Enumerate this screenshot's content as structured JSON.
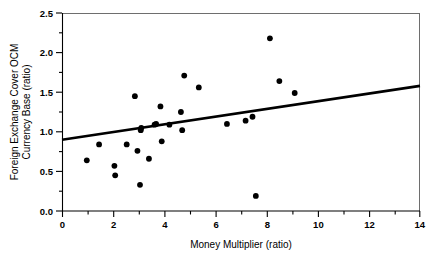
{
  "chart_data": {
    "type": "scatter",
    "title": "",
    "xlabel": "Money Multiplier (ratio)",
    "ylabel": "Foreign Exchange Cover OCM Currency Base (ratio)",
    "ylabel_line1": "Foreign Exchange Cover OCM",
    "ylabel_line2": "Currency Base (ratio)",
    "xlim": [
      0,
      14
    ],
    "ylim": [
      0.0,
      2.5
    ],
    "x_ticks_major": [
      0,
      2,
      4,
      6,
      8,
      10,
      12,
      14
    ],
    "x_ticks_major_labels": [
      "0",
      "2",
      "4",
      "6",
      "8",
      "10",
      "12",
      "14"
    ],
    "x_ticks_minor": [
      1,
      3,
      5,
      7,
      9,
      11,
      13
    ],
    "y_ticks_major": [
      0.0,
      0.5,
      1.0,
      1.5,
      2.0,
      2.5
    ],
    "y_ticks_major_labels": [
      "0.0",
      "0.5",
      "1.0",
      "1.5",
      "2.0",
      "2.5"
    ],
    "y_ticks_minor": [
      0.25,
      0.75,
      1.25,
      1.75,
      2.25
    ],
    "grid": false,
    "legend": "none",
    "marker": "filled-circle",
    "marker_color": "#000000",
    "points": [
      {
        "x": 0.97,
        "y": 0.64
      },
      {
        "x": 1.45,
        "y": 0.84
      },
      {
        "x": 2.05,
        "y": 0.57
      },
      {
        "x": 2.08,
        "y": 0.45
      },
      {
        "x": 2.53,
        "y": 0.84
      },
      {
        "x": 2.85,
        "y": 1.45
      },
      {
        "x": 2.95,
        "y": 0.76
      },
      {
        "x": 3.05,
        "y": 0.33
      },
      {
        "x": 3.08,
        "y": 1.02
      },
      {
        "x": 3.1,
        "y": 1.05
      },
      {
        "x": 3.4,
        "y": 0.66
      },
      {
        "x": 3.62,
        "y": 1.09
      },
      {
        "x": 3.68,
        "y": 1.1
      },
      {
        "x": 3.85,
        "y": 1.32
      },
      {
        "x": 3.9,
        "y": 0.88
      },
      {
        "x": 4.2,
        "y": 1.09
      },
      {
        "x": 4.65,
        "y": 1.25
      },
      {
        "x": 4.7,
        "y": 1.02
      },
      {
        "x": 4.78,
        "y": 1.71
      },
      {
        "x": 5.35,
        "y": 1.56
      },
      {
        "x": 6.45,
        "y": 1.1
      },
      {
        "x": 7.18,
        "y": 1.14
      },
      {
        "x": 7.45,
        "y": 1.19
      },
      {
        "x": 7.58,
        "y": 0.19
      },
      {
        "x": 8.13,
        "y": 2.18
      },
      {
        "x": 8.5,
        "y": 1.64
      },
      {
        "x": 9.1,
        "y": 1.49
      }
    ],
    "trendline": {
      "x_start": 0,
      "y_start": 0.9,
      "x_end": 14,
      "y_end": 1.58
    }
  }
}
